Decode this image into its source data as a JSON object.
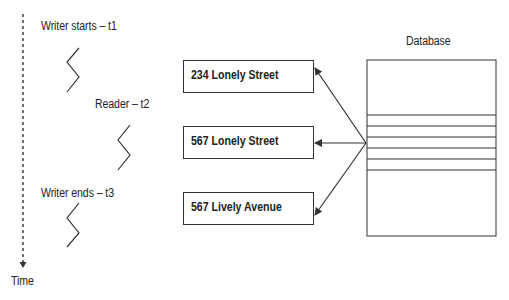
{
  "timeline": {
    "axis_label": "Time",
    "events": [
      {
        "label": "Writer starts – t1"
      },
      {
        "label": "Reader – t2"
      },
      {
        "label": "Writer ends – t3"
      }
    ]
  },
  "records": [
    {
      "label": "234 Lonely Street"
    },
    {
      "label": "567 Lonely Street"
    },
    {
      "label": "567 Lively Avenue"
    }
  ],
  "database": {
    "label": "Database",
    "row_lines": 6
  },
  "colors": {
    "stroke": "#333333",
    "text": "#222222",
    "background": "#ffffff"
  }
}
